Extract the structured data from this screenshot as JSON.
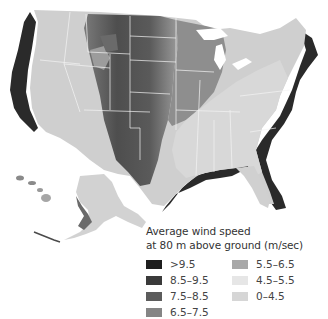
{
  "legend": {
    "title_line1": "Average wind speed",
    "title_line2": "at 80 m above ground (m/sec)",
    "items": [
      {
        "label": ">9.5",
        "color": "#1e1e1e"
      },
      {
        "label": "8.5–9.5",
        "color": "#3a3a3a"
      },
      {
        "label": "7.5–8.5",
        "color": "#5c5c5c"
      },
      {
        "label": "6.5–7.5",
        "color": "#858585"
      },
      {
        "label": "5.5–6.5",
        "color": "#a8a8a8"
      },
      {
        "label": "4.5–5.5",
        "color": "#e6e6e6"
      },
      {
        "label": "0–4.5",
        "color": "#d6d6d6"
      }
    ]
  },
  "map": {
    "subject": "United States wind resource map",
    "regions_shown": [
      "Contiguous United States",
      "Alaska",
      "Hawaii"
    ],
    "colors": {
      "background": "#ffffff",
      "state_borders": "#f4f4f4",
      "west_land": "#c9c9c9",
      "great_plains": "#5a5a5a",
      "midwest": "#8a8a8a",
      "southeast": "#d4d4d4",
      "offshore_band": "#2a2a2a"
    }
  }
}
